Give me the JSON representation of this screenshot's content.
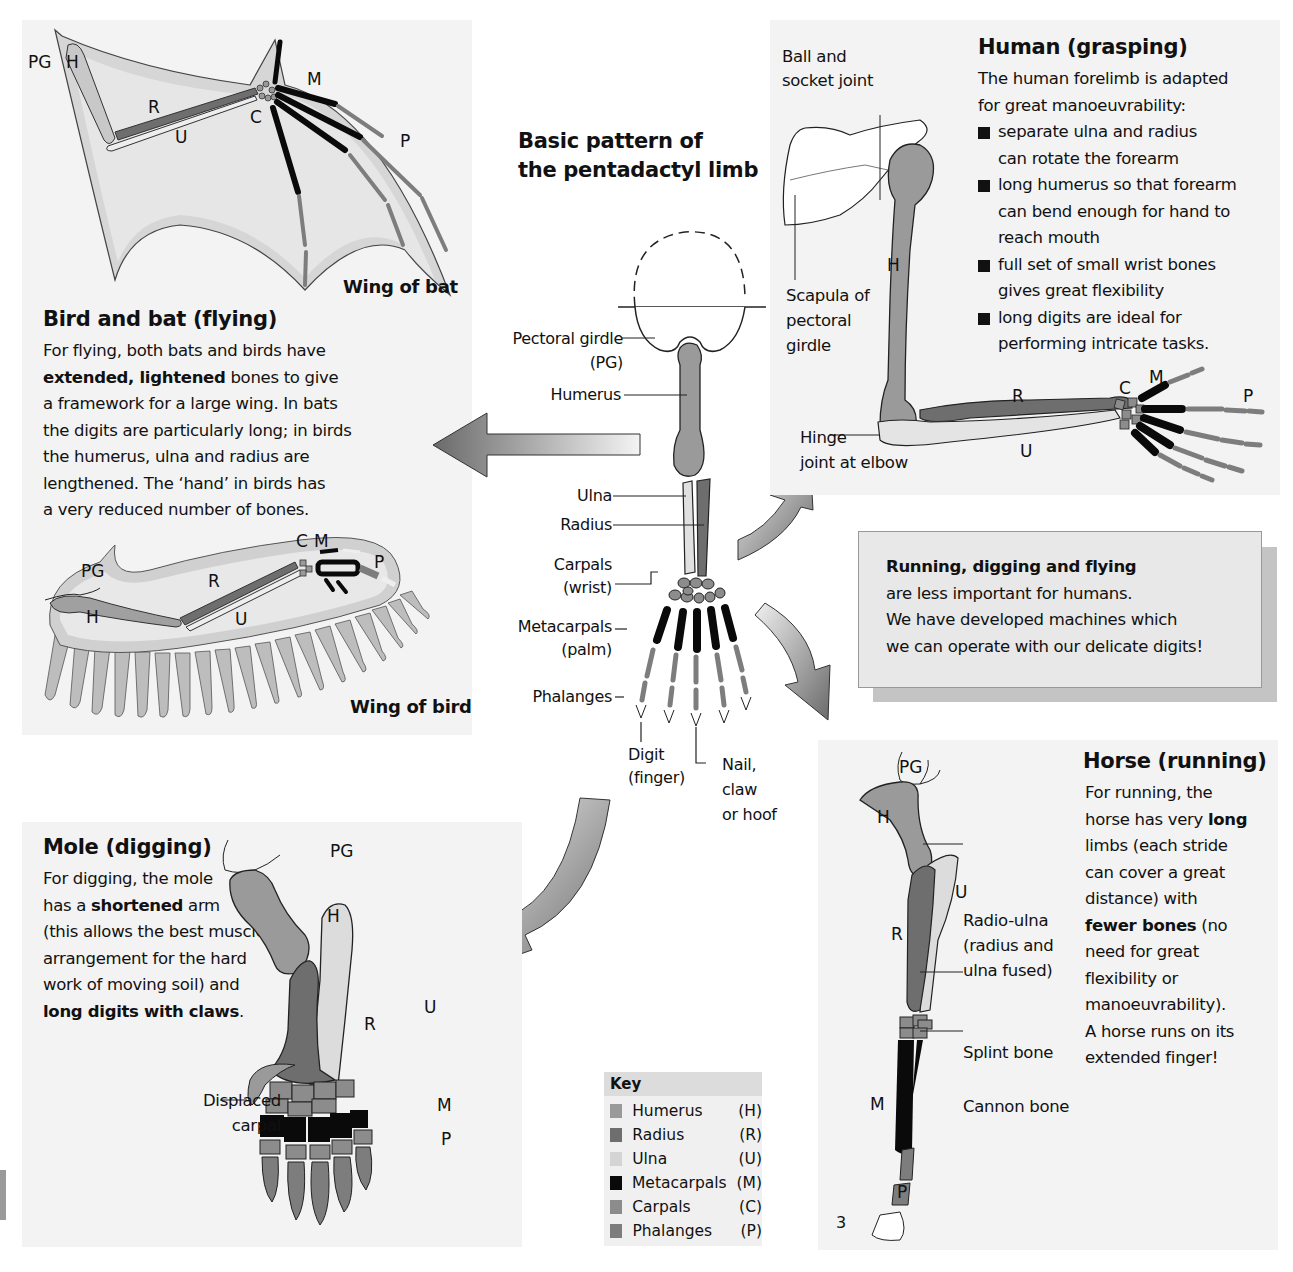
{
  "center": {
    "title_line1": "Basic pattern of",
    "title_line2": "the pentadactyl limb",
    "labels": {
      "pectoral_girdle": "Pectoral girdle",
      "pectoral_girdle_abbr": "(PG)",
      "humerus": "Humerus",
      "ulna": "Ulna",
      "radius": "Radius",
      "carpals": "Carpals",
      "carpals_sub": "(wrist)",
      "metacarpals": "Metacarpals",
      "metacarpals_sub": "(palm)",
      "phalanges": "Phalanges",
      "digit": "Digit",
      "digit_sub": "(finger)",
      "nail_1": "Nail,",
      "nail_2": "claw",
      "nail_3": "or hoof"
    }
  },
  "bat_bird": {
    "heading": "Bird and bat (flying)",
    "text": [
      {
        "t": "For flying, both bats and birds have"
      },
      {
        "b": "extended, lightened",
        "t": " bones to give"
      },
      {
        "t": "a framework for a large wing. In bats"
      },
      {
        "t": "the digits are particularly long; in birds"
      },
      {
        "t": "the humerus, ulna and radius are"
      },
      {
        "t": "lengthened. The ‘hand’ in birds has"
      },
      {
        "t": "a very reduced number of bones."
      }
    ],
    "bat_caption": "Wing of bat",
    "bird_caption": "Wing of bird",
    "bat_labels": {
      "pg": "PG",
      "h": "H",
      "r": "R",
      "u": "U",
      "c": "C",
      "m": "M",
      "p": "P"
    },
    "bird_labels": {
      "pg": "PG",
      "h": "H",
      "r": "R",
      "u": "U",
      "c": "C",
      "m": "M",
      "p": "P"
    }
  },
  "human": {
    "heading": "Human (grasping)",
    "intro_1": "The human forelimb is adapted",
    "intro_2": "for great manoeuvrability:",
    "bullets": [
      {
        "l1": "separate ulna and radius",
        "l2": "can rotate the forearm"
      },
      {
        "l1": "long humerus so that forearm",
        "l2": "can bend enough for hand to",
        "l3": "reach mouth"
      },
      {
        "l1": "full set of small wrist bones",
        "l2": "gives great flexibility"
      },
      {
        "l1": "long digits are ideal for",
        "l2": "performing intricate tasks."
      }
    ],
    "ball_socket_1": "Ball and",
    "ball_socket_2": "socket joint",
    "scapula_1": "Scapula of",
    "scapula_2": "pectoral",
    "scapula_3": "girdle",
    "hinge_1": "Hinge",
    "hinge_2": "joint at elbow",
    "labels": {
      "h": "H",
      "r": "R",
      "u": "U",
      "c": "C",
      "m": "M",
      "p": "P"
    }
  },
  "callout": {
    "heading": "Running, digging and flying",
    "line1": "are less important for humans.",
    "line2": "We have developed machines which",
    "line3": "we can operate with our delicate digits!"
  },
  "horse": {
    "heading": "Horse (running)",
    "text": [
      {
        "t": "For running, the"
      },
      {
        "t": "horse has very ",
        "b": "long"
      },
      {
        "t": "limbs (each stride"
      },
      {
        "t": "can cover a great"
      },
      {
        "t": "distance) with"
      },
      {
        "b": "fewer bones",
        "t": " (no"
      },
      {
        "t": "need for great"
      },
      {
        "t": "flexibility or"
      },
      {
        "t": "manoeuvrability)."
      },
      {
        "t": "A horse runs on its"
      },
      {
        "t": "extended finger!"
      }
    ],
    "radio_ulna_1": "Radio-ulna",
    "radio_ulna_2": "(radius and",
    "radio_ulna_3": "ulna fused)",
    "splint": "Splint bone",
    "cannon": "Cannon bone",
    "digit_number": "3",
    "labels": {
      "pg": "PG",
      "h": "H",
      "r": "R",
      "u": "U",
      "m": "M",
      "p": "P"
    }
  },
  "mole": {
    "heading": "Mole (digging)",
    "text": [
      {
        "t": "For digging, the mole"
      },
      {
        "t": "has a ",
        "b": "shortened",
        "t2": " arm"
      },
      {
        "t": "(this allows the best muscle"
      },
      {
        "t": "arrangement for the hard"
      },
      {
        "t": "work of moving soil) and"
      },
      {
        "b": "long digits with claws",
        "t2": "."
      }
    ],
    "displaced_1": "Displaced",
    "displaced_2": "carpal",
    "labels": {
      "pg": "PG",
      "h": "H",
      "r": "R",
      "u": "U",
      "m": "M",
      "p": "P"
    }
  },
  "key": {
    "title": "Key",
    "items": [
      {
        "name": "Humerus",
        "abbr": "(H)",
        "color": "#9a9a9a"
      },
      {
        "name": "Radius",
        "abbr": "(R)",
        "color": "#6e6e6e"
      },
      {
        "name": "Ulna",
        "abbr": "(U)",
        "color": "#d4d4d4"
      },
      {
        "name": "Metacarpals",
        "abbr": "(M)",
        "color": "#0a0a0a"
      },
      {
        "name": "Carpals",
        "abbr": "(C)",
        "color": "#8c8c8c"
      },
      {
        "name": "Phalanges",
        "abbr": "(P)",
        "color": "#7d7d7d"
      }
    ]
  },
  "colors": {
    "humerus": "#9a9a9a",
    "radius": "#6e6e6e",
    "ulna": "#dcdcdc",
    "metacarpal": "#0a0a0a",
    "carpal": "#8c8c8c",
    "phalange": "#7d7d7d",
    "membrane": "#d9d9d9",
    "panel": "#f3f3f3"
  }
}
